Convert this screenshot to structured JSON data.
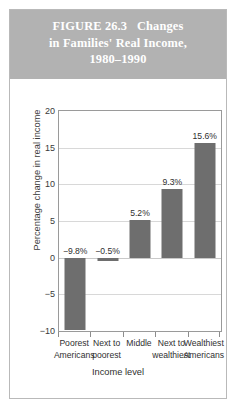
{
  "figure": {
    "title_lines": [
      "FIGURE 26.3   Changes",
      "in Families' Real Income,",
      "1980–1990"
    ],
    "header_color": "#b2b2b2",
    "title_color": "#ffffff",
    "border_color": "#b9b9b9"
  },
  "chart_data": {
    "type": "bar",
    "categories": [
      "Poorest Americans",
      "Next to poorest",
      "Middle",
      "Next to wealthiest",
      "Wealthiest Americans"
    ],
    "category_lines": [
      [
        "Poorest",
        "Americans"
      ],
      [
        "Next to",
        "poorest"
      ],
      [
        "Middle",
        ""
      ],
      [
        "Next to",
        "wealthiest"
      ],
      [
        "Wealthiest",
        "Americans"
      ]
    ],
    "values": [
      -9.8,
      -0.5,
      5.2,
      9.3,
      15.6
    ],
    "value_labels": [
      "−9.8%",
      "−0.5%",
      "5.2%",
      "9.3%",
      "15.6%"
    ],
    "xlabel": "Income level",
    "ylabel": "Percentage change in real income",
    "ylim": [
      -10,
      20
    ],
    "yticks": [
      20,
      15,
      10,
      5,
      0,
      -5,
      -10
    ],
    "ytick_labels": [
      "20",
      "15",
      "10",
      "5",
      "0",
      "−5",
      "−10"
    ],
    "grid": true,
    "legend": false,
    "bar_color": "#6e6e6e",
    "gridline_color": "#d8d8d8",
    "axis_color": "#9a9a9a"
  }
}
